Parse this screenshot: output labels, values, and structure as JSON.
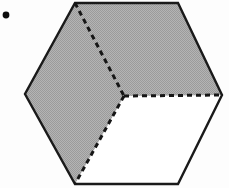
{
  "figure": {
    "width": 229,
    "height": 188,
    "background_color": "#fdfdfd"
  },
  "style": {
    "outline_color": "#1a1a1a",
    "outline_width": 2.4,
    "dash_color": "#161616",
    "dash_width": 3.0,
    "dash_pattern": "5 4",
    "shade_fill": "#a9a9a9",
    "unshaded_fill": "#ffffff",
    "bullet_color": "#0d0d0d"
  },
  "geometry": {
    "hexagon_label": "hexagon",
    "vertices": [
      {
        "name": "top-left",
        "x": 75,
        "y": 3
      },
      {
        "name": "top-right",
        "x": 178,
        "y": 3
      },
      {
        "name": "right",
        "x": 222,
        "y": 95
      },
      {
        "name": "bottom-right",
        "x": 178,
        "y": 184
      },
      {
        "name": "bottom-left",
        "x": 75,
        "y": 184
      },
      {
        "name": "left",
        "x": 25,
        "y": 94
      }
    ],
    "center": {
      "name": "center",
      "x": 124,
      "y": 96
    },
    "outline_path": "M 75 3 L 178 3 L 222 95 L 178 184 L 75 184 L 25 94 Z",
    "shaded_region": {
      "label": "shaded-region",
      "fill": "#a9a9a9",
      "path": "M 75 3 L 178 3 L 222 95 L 124 96 L 75 184 L 25 94 Z"
    },
    "unshaded_region": {
      "label": "unshaded-region",
      "fill": "#ffffff",
      "path": "M 124 96 L 222 95 L 178 184 L 75 184 Z"
    },
    "rhombi": [
      {
        "name": "upper-rhombus",
        "shaded": true,
        "path": "M 75 3 L 178 3 L 222 95 L 124 96 Z"
      },
      {
        "name": "left-rhombus",
        "shaded": true,
        "path": "M 75 3 L 124 96 L 75 184 L 25 94 Z"
      },
      {
        "name": "lower-right-rhombus",
        "shaded": false,
        "path": "M 124 96 L 222 95 L 178 184 L 75 184 Z"
      }
    ],
    "dashed_segments": [
      {
        "name": "dashed-top-left-to-center",
        "x1": 75,
        "y1": 3,
        "x2": 124,
        "y2": 96
      },
      {
        "name": "dashed-center-to-right",
        "x1": 124,
        "y1": 96,
        "x2": 222,
        "y2": 95
      },
      {
        "name": "dashed-center-to-bottom-left",
        "x1": 124,
        "y1": 96,
        "x2": 75,
        "y2": 184
      }
    ],
    "bullet": {
      "name": "bullet-dot",
      "cx": 6,
      "cy": 15,
      "r": 3.4
    }
  }
}
